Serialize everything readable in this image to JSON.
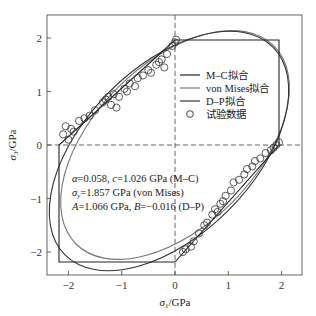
{
  "chart_data": {
    "type": "scatter",
    "title": "",
    "xlabel": "σ1/GPa",
    "ylabel": "σ3/GPa",
    "xlim": [
      -2.4,
      2.4
    ],
    "ylim": [
      -2.4,
      2.4
    ],
    "xticks": [
      -2,
      -1,
      0,
      1,
      2
    ],
    "yticks": [
      -2,
      -1,
      0,
      1,
      2
    ],
    "grid": false,
    "reference_lines": [
      {
        "type": "hline",
        "y": 0,
        "style": "dashed"
      },
      {
        "type": "vline",
        "x": 0,
        "style": "dashed"
      }
    ],
    "legend_position": "upper right (inside)",
    "series": [
      {
        "name": "M–C拟合",
        "kind": "line",
        "color": "#222222",
        "shape": "hexagon",
        "vertices": [
          [
            0,
            1.96
          ],
          [
            1.96,
            1.96
          ],
          [
            1.96,
            0
          ],
          [
            0,
            -2.18
          ],
          [
            -2.18,
            -2.18
          ],
          [
            -2.18,
            0
          ],
          [
            0,
            1.96
          ]
        ]
      },
      {
        "name": "von Mises拟合",
        "kind": "line",
        "color": "#777777",
        "shape": "ellipse",
        "equation": "σ1² − σ1σ3 + σ3² = σy²",
        "sigma_y": 1.857
      },
      {
        "name": "D–P拟合",
        "kind": "line",
        "color": "#333333",
        "shape": "ellipse",
        "A": 1.066,
        "B": -0.016
      },
      {
        "name": "试验数据",
        "kind": "scatter",
        "marker": "open-circle",
        "points": [
          [
            -2.1,
            0.2
          ],
          [
            -2.05,
            0.35
          ],
          [
            -2.0,
            0.1
          ],
          [
            -1.95,
            0.3
          ],
          [
            -1.9,
            0.25
          ],
          [
            -1.8,
            0.45
          ],
          [
            -1.7,
            0.5
          ],
          [
            -1.6,
            0.55
          ],
          [
            -1.5,
            0.65
          ],
          [
            -1.35,
            0.8
          ],
          [
            -1.3,
            0.85
          ],
          [
            -1.25,
            0.9
          ],
          [
            -1.2,
            0.75
          ],
          [
            -1.15,
            0.95
          ],
          [
            -1.1,
            0.7
          ],
          [
            -1.05,
            0.9
          ],
          [
            -0.95,
            1.05
          ],
          [
            -0.9,
            1.0
          ],
          [
            -0.85,
            1.15
          ],
          [
            -0.75,
            1.1
          ],
          [
            -0.7,
            1.25
          ],
          [
            -0.6,
            1.3
          ],
          [
            -0.5,
            1.4
          ],
          [
            -0.45,
            1.35
          ],
          [
            -0.35,
            1.5
          ],
          [
            -0.3,
            1.55
          ],
          [
            -0.25,
            1.6
          ],
          [
            -0.2,
            1.45
          ],
          [
            -0.15,
            1.7
          ],
          [
            -0.05,
            1.85
          ],
          [
            0.0,
            1.92
          ],
          [
            0.02,
            1.97
          ],
          [
            0.15,
            -2.0
          ],
          [
            0.2,
            -1.95
          ],
          [
            0.3,
            -1.9
          ],
          [
            0.35,
            -1.8
          ],
          [
            0.45,
            -1.65
          ],
          [
            0.55,
            -1.5
          ],
          [
            0.6,
            -1.45
          ],
          [
            0.7,
            -1.3
          ],
          [
            0.75,
            -1.2
          ],
          [
            0.8,
            -1.25
          ],
          [
            0.85,
            -1.1
          ],
          [
            0.9,
            -1.05
          ],
          [
            0.95,
            -0.95
          ],
          [
            1.05,
            -0.85
          ],
          [
            1.1,
            -0.7
          ],
          [
            1.2,
            -0.65
          ],
          [
            1.3,
            -0.55
          ],
          [
            1.35,
            -0.45
          ],
          [
            1.45,
            -0.4
          ],
          [
            1.5,
            -0.3
          ],
          [
            1.6,
            -0.25
          ],
          [
            1.7,
            -0.15
          ],
          [
            1.8,
            -0.1
          ],
          [
            1.85,
            -0.05
          ],
          [
            1.9,
            0.0
          ],
          [
            1.95,
            0.05
          ]
        ]
      }
    ],
    "annotations": [
      "α=0.058, c=1.026 GPa (M–C)",
      "σy=1.857 GPa (von Mises)",
      "A=1.066 GPa, B=−0.016 (D–P)"
    ]
  },
  "axes": {
    "x_label_main": "σ",
    "x_label_sub": "1",
    "x_label_unit": "/GPa",
    "y_label_main": "σ",
    "y_label_sub": "3",
    "y_label_unit": "/GPa",
    "x_ticks": [
      "−2",
      "−1",
      "0",
      "1",
      "2"
    ],
    "y_ticks": [
      "2",
      "1",
      "0",
      "−1",
      "−2"
    ]
  },
  "legend": {
    "items": [
      {
        "label": "M–C拟合",
        "color": "#222222"
      },
      {
        "label": "von Mises拟合",
        "color": "#777777"
      },
      {
        "label": "D–P拟合",
        "color": "#333333"
      },
      {
        "label": "试验数据",
        "marker": "open-circle"
      }
    ]
  },
  "annotation": {
    "line1_a": "α",
    "line1_b": "=0.058, ",
    "line1_c": "c",
    "line1_d": "=1.026 GPa (M–C)",
    "line2_a": "σ",
    "line2_sub": "y",
    "line2_b": "=1.857 GPa (von Mises)",
    "line3_a": "A",
    "line3_b": "=1.066 GPa, ",
    "line3_c": "B",
    "line3_d": "=−0.016 (D–P)"
  }
}
